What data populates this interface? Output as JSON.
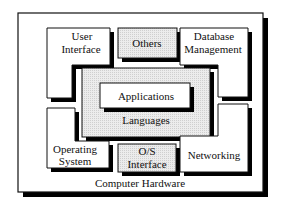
{
  "diagram": {
    "outer": {
      "label": "Computer Hardware"
    },
    "blocks": {
      "user_interface": {
        "line1": "User",
        "line2": "Interface"
      },
      "others": {
        "label": "Others"
      },
      "database_management": {
        "line1": "Database",
        "line2": "Management"
      },
      "languages": {
        "label": "Languages"
      },
      "applications": {
        "label": "Applications"
      },
      "operating_system": {
        "line1": "Operating",
        "line2": "System"
      },
      "os_interface": {
        "line1": "O/S",
        "line2": "Interface"
      },
      "networking": {
        "label": "Networking"
      }
    },
    "colors": {
      "stroke": "#111111",
      "shadow": "#000000",
      "shaded_fill": "#e6e6e6",
      "plain_fill": "#ffffff"
    }
  }
}
